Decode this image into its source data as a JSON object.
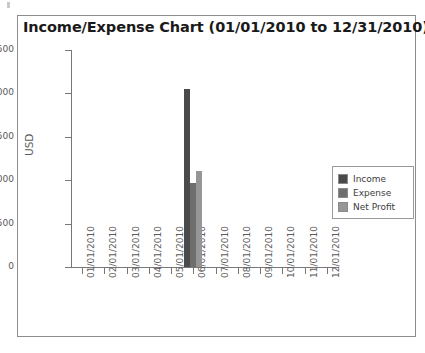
{
  "chart_data": {
    "type": "bar",
    "title": "Income/Expense Chart (01/01/2010 to 12/31/2010)",
    "xlabel": "",
    "ylabel": "USD",
    "ylim": [
      0,
      2500
    ],
    "yticks": [
      0,
      500,
      1000,
      1500,
      2000,
      2500
    ],
    "ytick_labels": [
      "0",
      "500",
      "1000",
      "1500",
      "2000",
      "2500"
    ],
    "grid": false,
    "legend_position": "right",
    "categories": [
      "01/01/2010",
      "02/01/2010",
      "03/01/2010",
      "04/01/2010",
      "05/01/2010",
      "06/01/2010",
      "07/01/2010",
      "08/01/2010",
      "09/01/2010",
      "10/01/2010",
      "11/01/2010",
      "12/01/2010"
    ],
    "series": [
      {
        "name": "Income",
        "color": "#4a4a4a",
        "values": [
          0,
          0,
          0,
          0,
          0,
          2050,
          0,
          0,
          0,
          0,
          0,
          0
        ]
      },
      {
        "name": "Expense",
        "color": "#6e6e6e",
        "values": [
          0,
          0,
          0,
          0,
          0,
          965,
          0,
          0,
          0,
          0,
          0,
          0
        ]
      },
      {
        "name": "Net Profit",
        "color": "#969696",
        "values": [
          0,
          0,
          0,
          0,
          0,
          1105,
          0,
          0,
          0,
          0,
          0,
          0
        ]
      }
    ]
  },
  "legend": {
    "items": [
      {
        "label": "Income",
        "color": "#4a4a4a"
      },
      {
        "label": "Expense",
        "color": "#6e6e6e"
      },
      {
        "label": "Net Profit",
        "color": "#969696"
      }
    ]
  }
}
